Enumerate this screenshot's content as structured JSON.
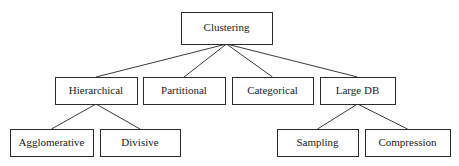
{
  "diagram": {
    "title": "Clustering",
    "type": "taxonomy-tree",
    "background_color": "#ffffff",
    "box_stroke_color": "#2b2b2b",
    "edge_color": "#3a3a3a",
    "text_color": "#1a1a1a",
    "nodes": [
      {
        "id": "clustering",
        "label": "Clustering",
        "level": 0,
        "x": 181,
        "y": 12,
        "width": 91,
        "height": 32
      },
      {
        "id": "hierarchical",
        "label": "Hierarchical",
        "level": 1,
        "x": 55,
        "y": 77,
        "width": 82,
        "height": 27
      },
      {
        "id": "partitional",
        "label": "Partitional",
        "level": 1,
        "x": 143,
        "y": 77,
        "width": 82,
        "height": 27
      },
      {
        "id": "categorical",
        "label": "Categorical",
        "level": 1,
        "x": 232,
        "y": 77,
        "width": 81,
        "height": 27
      },
      {
        "id": "large-db",
        "label": "Large DB",
        "level": 1,
        "x": 320,
        "y": 77,
        "width": 75,
        "height": 27
      },
      {
        "id": "agglomerative",
        "label": "Agglomerative",
        "level": 2,
        "x": 10,
        "y": 129,
        "width": 83,
        "height": 27
      },
      {
        "id": "divisive",
        "label": "Divisive",
        "level": 2,
        "x": 100,
        "y": 129,
        "width": 80,
        "height": 27
      },
      {
        "id": "sampling",
        "label": "Sampling",
        "level": 2,
        "x": 277,
        "y": 129,
        "width": 81,
        "height": 27
      },
      {
        "id": "compression",
        "label": "Compression",
        "level": 2,
        "x": 365,
        "y": 129,
        "width": 85,
        "height": 27
      }
    ],
    "edges": [
      {
        "from": "clustering",
        "to": "hierarchical"
      },
      {
        "from": "clustering",
        "to": "partitional"
      },
      {
        "from": "clustering",
        "to": "categorical"
      },
      {
        "from": "clustering",
        "to": "large-db"
      },
      {
        "from": "hierarchical",
        "to": "agglomerative"
      },
      {
        "from": "hierarchical",
        "to": "divisive"
      },
      {
        "from": "large-db",
        "to": "sampling"
      },
      {
        "from": "large-db",
        "to": "compression"
      }
    ]
  }
}
